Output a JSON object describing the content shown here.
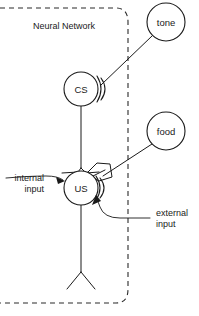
{
  "diagram": {
    "background_color": "#ffffff",
    "ink_color": "#1a1a1a",
    "boundary": {
      "label": "Neural Network",
      "style": "dashed",
      "label_x": 64,
      "label_y": 29
    },
    "nodes": [
      {
        "id": "tone",
        "label": "tone",
        "cx": 166,
        "cy": 22,
        "r": 19,
        "inside_boundary": false
      },
      {
        "id": "food",
        "label": "food",
        "cx": 166,
        "cy": 131,
        "r": 19,
        "inside_boundary": false
      },
      {
        "id": "cs",
        "label": "CS",
        "cx": 81,
        "cy": 89,
        "r": 17,
        "inside_boundary": true
      },
      {
        "id": "us",
        "label": "US",
        "cx": 81,
        "cy": 188,
        "r": 17,
        "inside_boundary": true
      }
    ],
    "connections": [
      {
        "id": "tone-to-cs",
        "from": "tone",
        "to": "cs",
        "type": "external-input-line"
      },
      {
        "id": "food-to-us",
        "from": "food",
        "to": "us",
        "type": "external-input-line"
      },
      {
        "id": "cs-to-us",
        "from": "cs",
        "to": "us",
        "type": "internal-axon"
      }
    ],
    "callouts": [
      {
        "id": "internal-input",
        "line1": "internal",
        "line2": "input",
        "target_node": "us",
        "label_x": 44,
        "label_y1": 181,
        "label_y2": 192,
        "align": "end"
      },
      {
        "id": "external-input",
        "line1": "external",
        "line2": "input",
        "target_node": "us",
        "label_x": 156,
        "label_y1": 216,
        "label_y2": 227,
        "align": "start"
      }
    ]
  }
}
